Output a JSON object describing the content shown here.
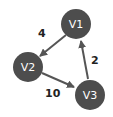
{
  "diagram": {
    "type": "directed-weighted-graph",
    "node_color": "#4d4d4d",
    "edge_color": "#555555",
    "nodes": [
      {
        "id": "V1",
        "label": "V1",
        "cx": 76,
        "cy": 24
      },
      {
        "id": "V2",
        "label": "V2",
        "cx": 28,
        "cy": 67
      },
      {
        "id": "V3",
        "label": "V3",
        "cx": 90,
        "cy": 95
      }
    ],
    "edges": [
      {
        "from": "V1",
        "to": "V2",
        "weight": "4"
      },
      {
        "from": "V2",
        "to": "V3",
        "weight": "10"
      },
      {
        "from": "V3",
        "to": "V1",
        "weight": "2"
      }
    ]
  }
}
